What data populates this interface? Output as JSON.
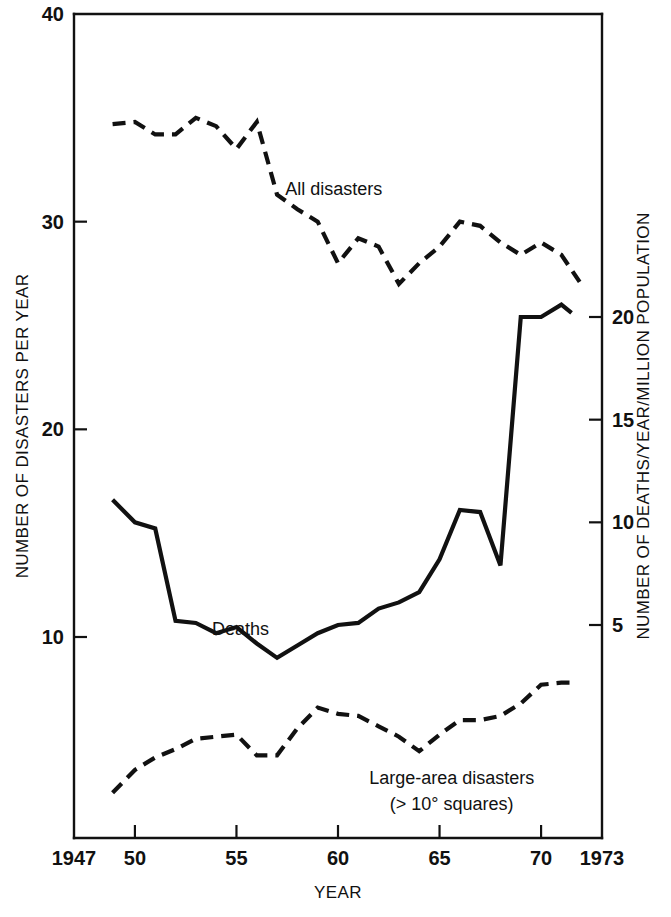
{
  "chart_data": {
    "type": "line",
    "title": "",
    "xlabel": "YEAR",
    "ylabel": "NUMBER OF DISASTERS PER YEAR",
    "y2label": "NUMBER OF DEATHS/YEAR/MILLION POPULATION",
    "xlim": [
      1947,
      1973
    ],
    "ylim": [
      0,
      40
    ],
    "y2lim": [
      0,
      20.6
    ],
    "grid": false,
    "legend_position": "inline-annotations",
    "x_ticks": [
      {
        "value": 1947,
        "label": "1947"
      },
      {
        "value": 1950,
        "label": "50"
      },
      {
        "value": 1955,
        "label": "55"
      },
      {
        "value": 1960,
        "label": "60"
      },
      {
        "value": 1965,
        "label": "65"
      },
      {
        "value": 1970,
        "label": "70"
      },
      {
        "value": 1973,
        "label": "1973"
      }
    ],
    "y_ticks": [
      {
        "value": 10,
        "label": "10"
      },
      {
        "value": 20,
        "label": "20"
      },
      {
        "value": 30,
        "label": "30"
      },
      {
        "value": 40,
        "label": "40"
      }
    ],
    "y2_ticks": [
      {
        "value": 5,
        "label": "5"
      },
      {
        "value": 10,
        "label": "10"
      },
      {
        "value": 15,
        "label": "15"
      },
      {
        "value": 20,
        "label": "20"
      }
    ],
    "series": [
      {
        "name": "All disasters",
        "axis": "left",
        "style": "dashed",
        "color": "#111111",
        "x": [
          1948.9,
          1950,
          1951,
          1952,
          1953,
          1954,
          1955,
          1956,
          1957,
          1958,
          1959,
          1960,
          1961,
          1962,
          1963,
          1964,
          1965,
          1966,
          1967,
          1968,
          1969,
          1970,
          1971,
          1971.9
        ],
        "values": [
          34.7,
          34.8,
          34.2,
          34.2,
          35.0,
          34.6,
          33.5,
          34.8,
          31.3,
          30.6,
          30.0,
          28.0,
          29.2,
          28.8,
          27.0,
          28.0,
          28.8,
          30.0,
          29.8,
          29.0,
          28.4,
          29.0,
          28.4,
          27.1
        ]
      },
      {
        "name": "Deaths",
        "axis": "right",
        "style": "solid",
        "color": "#111111",
        "x": [
          1948.9,
          1950,
          1951,
          1952,
          1953,
          1954,
          1955,
          1956,
          1957,
          1958,
          1959,
          1960,
          1961,
          1962,
          1963,
          1964,
          1965,
          1966,
          1967,
          1968,
          1969,
          1970,
          1971,
          1971.5
        ],
        "values": [
          11.1,
          10.0,
          9.7,
          5.2,
          5.1,
          4.6,
          4.9,
          4.1,
          3.4,
          4.0,
          4.6,
          5.0,
          5.1,
          5.8,
          6.1,
          6.6,
          8.2,
          10.6,
          10.5,
          7.9,
          20.0,
          20.0,
          20.6,
          20.2
        ]
      },
      {
        "name": "Large-area disasters (> 10° squares)",
        "axis": "left",
        "style": "dashed",
        "color": "#111111",
        "x": [
          1948.9,
          1950,
          1951,
          1952,
          1953,
          1954,
          1955,
          1956,
          1957,
          1958,
          1959,
          1960,
          1961,
          1962,
          1963,
          1964,
          1965,
          1966,
          1967,
          1968,
          1969,
          1970,
          1971,
          1971.6
        ],
        "values": [
          2.5,
          3.6,
          4.2,
          4.6,
          5.1,
          5.2,
          5.3,
          4.3,
          4.3,
          5.6,
          6.6,
          6.3,
          6.2,
          5.7,
          5.2,
          4.5,
          5.3,
          6.0,
          6.0,
          6.2,
          6.8,
          7.7,
          7.8,
          7.8
        ]
      }
    ],
    "annotations": [
      {
        "name": "all-disasters-label",
        "text": "All disasters",
        "x": 1957.4,
        "y": 31.3
      },
      {
        "name": "deaths-label",
        "text": "Deaths",
        "x": 1953.8,
        "y": 10.1
      },
      {
        "name": "large-area-label-line1",
        "text": "Large-area disasters",
        "x": 1965.6,
        "y": 2.9
      },
      {
        "name": "large-area-label-line2",
        "text": "(> 10° squares)",
        "x": 1965.6,
        "y": 1.65
      }
    ]
  }
}
